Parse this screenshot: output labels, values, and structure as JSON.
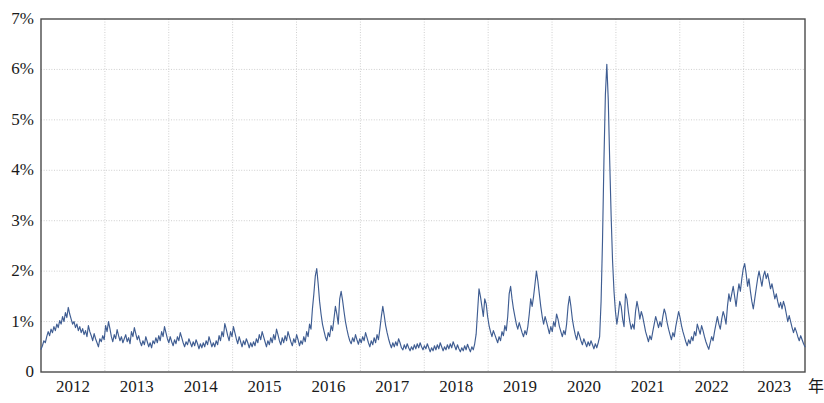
{
  "chart_data": {
    "type": "line",
    "title": "",
    "subtitle": "",
    "xlabel": "年",
    "ylabel": "",
    "grid": true,
    "legend_position": "none",
    "series_color": "#3f5d92",
    "axis_color": "#4a4a4a",
    "grid_color": "#cfcfcf",
    "background": "#ffffff",
    "xlim": [
      2012.0,
      2023.96
    ],
    "ylim": [
      0,
      7
    ],
    "y_ticks": [
      0,
      1,
      2,
      3,
      4,
      5,
      6,
      7
    ],
    "y_tick_labels": [
      "0",
      "1%",
      "2%",
      "3%",
      "4%",
      "5%",
      "6%",
      "7%"
    ],
    "x_ticks": [
      2012,
      2013,
      2014,
      2015,
      2016,
      2017,
      2018,
      2019,
      2020,
      2021,
      2022,
      2023
    ],
    "x_tick_labels": [
      "2012",
      "2013",
      "2014",
      "2015",
      "2016",
      "2017",
      "2018",
      "2019",
      "2020",
      "2021",
      "2022",
      "2023"
    ],
    "x_unit_label": "年",
    "annotations": [],
    "series": [
      {
        "name": "series-1",
        "values": [
          0.45,
          0.52,
          0.62,
          0.58,
          0.7,
          0.8,
          0.72,
          0.85,
          0.78,
          0.9,
          0.82,
          0.95,
          0.88,
          1.02,
          0.95,
          1.1,
          1.0,
          1.18,
          1.08,
          1.28,
          1.15,
          1.05,
          0.95,
          1.0,
          0.88,
          0.95,
          0.82,
          0.9,
          0.78,
          0.86,
          0.74,
          0.82,
          0.7,
          0.92,
          0.8,
          0.72,
          0.62,
          0.76,
          0.66,
          0.58,
          0.5,
          0.66,
          0.6,
          0.72,
          0.64,
          0.92,
          0.8,
          1.0,
          0.86,
          0.7,
          0.6,
          0.74,
          0.66,
          0.84,
          0.72,
          0.62,
          0.7,
          0.58,
          0.66,
          0.74,
          0.6,
          0.68,
          0.56,
          0.8,
          0.7,
          0.88,
          0.76,
          0.64,
          0.72,
          0.6,
          0.52,
          0.62,
          0.54,
          0.7,
          0.6,
          0.5,
          0.58,
          0.48,
          0.62,
          0.56,
          0.68,
          0.58,
          0.72,
          0.62,
          0.8,
          0.7,
          0.9,
          0.78,
          0.66,
          0.58,
          0.7,
          0.6,
          0.52,
          0.64,
          0.56,
          0.7,
          0.62,
          0.78,
          0.68,
          0.58,
          0.5,
          0.6,
          0.54,
          0.66,
          0.58,
          0.5,
          0.6,
          0.52,
          0.64,
          0.56,
          0.46,
          0.56,
          0.48,
          0.58,
          0.5,
          0.62,
          0.54,
          0.7,
          0.6,
          0.5,
          0.58,
          0.5,
          0.62,
          0.54,
          0.72,
          0.62,
          0.8,
          0.7,
          0.96,
          0.85,
          0.72,
          0.62,
          0.8,
          0.7,
          0.9,
          0.78,
          0.66,
          0.56,
          0.7,
          0.6,
          0.5,
          0.62,
          0.54,
          0.66,
          0.58,
          0.48,
          0.58,
          0.5,
          0.6,
          0.52,
          0.66,
          0.58,
          0.74,
          0.64,
          0.8,
          0.7,
          0.6,
          0.5,
          0.62,
          0.54,
          0.68,
          0.58,
          0.74,
          0.64,
          0.85,
          0.74,
          0.62,
          0.54,
          0.68,
          0.58,
          0.72,
          0.62,
          0.8,
          0.7,
          0.6,
          0.52,
          0.66,
          0.58,
          0.74,
          0.64,
          0.52,
          0.62,
          0.55,
          0.7,
          0.6,
          0.8,
          0.7,
          0.95,
          0.85,
          1.25,
          1.55,
          1.9,
          2.05,
          1.75,
          1.4,
          1.15,
          0.95,
          0.82,
          0.7,
          0.62,
          0.78,
          0.7,
          0.92,
          0.82,
          1.05,
          1.3,
          1.15,
          0.95,
          1.45,
          1.6,
          1.42,
          1.2,
          1.0,
          0.85,
          0.72,
          0.62,
          0.56,
          0.68,
          0.6,
          0.74,
          0.64,
          0.55,
          0.66,
          0.58,
          0.7,
          0.62,
          0.78,
          0.68,
          0.58,
          0.5,
          0.62,
          0.54,
          0.68,
          0.58,
          0.74,
          0.64,
          0.86,
          1.1,
          1.3,
          1.12,
          0.92,
          0.78,
          0.66,
          0.56,
          0.48,
          0.58,
          0.5,
          0.6,
          0.52,
          0.66,
          0.58,
          0.48,
          0.44,
          0.54,
          0.46,
          0.56,
          0.48,
          0.42,
          0.5,
          0.44,
          0.54,
          0.46,
          0.56,
          0.48,
          0.58,
          0.5,
          0.44,
          0.52,
          0.46,
          0.56,
          0.48,
          0.4,
          0.48,
          0.42,
          0.52,
          0.44,
          0.54,
          0.46,
          0.58,
          0.5,
          0.42,
          0.5,
          0.44,
          0.54,
          0.46,
          0.56,
          0.48,
          0.6,
          0.52,
          0.44,
          0.54,
          0.46,
          0.4,
          0.48,
          0.42,
          0.52,
          0.44,
          0.55,
          0.47,
          0.4,
          0.5,
          0.44,
          0.56,
          0.75,
          1.2,
          1.65,
          1.5,
          1.3,
          1.1,
          1.45,
          1.35,
          1.1,
          0.92,
          0.8,
          0.7,
          0.82,
          0.74,
          0.66,
          0.58,
          0.7,
          0.62,
          0.8,
          0.72,
          0.92,
          0.82,
          1.1,
          1.55,
          1.7,
          1.45,
          1.25,
          1.1,
          0.95,
          0.85,
          0.98,
          0.88,
          0.78,
          0.7,
          0.82,
          0.74,
          0.9,
          1.15,
          1.45,
          1.3,
          1.5,
          1.75,
          2.0,
          1.8,
          1.55,
          1.3,
          1.1,
          0.95,
          1.1,
          1.0,
          0.88,
          0.76,
          0.9,
          0.8,
          1.0,
          0.9,
          1.15,
          1.05,
          0.9,
          0.8,
          0.7,
          0.82,
          0.74,
          0.95,
          1.3,
          1.5,
          1.3,
          1.05,
          0.88,
          0.74,
          0.64,
          0.8,
          0.72,
          0.62,
          0.54,
          0.66,
          0.58,
          0.5,
          0.6,
          0.52,
          0.62,
          0.54,
          0.46,
          0.56,
          0.48,
          0.58,
          0.7,
          1.4,
          2.6,
          4.2,
          5.5,
          6.1,
          5.4,
          4.2,
          3.1,
          2.2,
          1.6,
          1.2,
          0.95,
          1.15,
          1.4,
          1.3,
          1.05,
          0.9,
          1.55,
          1.45,
          1.2,
          1.0,
          0.85,
          0.95,
          0.85,
          1.2,
          1.4,
          1.25,
          1.05,
          1.2,
          1.1,
          0.95,
          0.8,
          0.7,
          0.6,
          0.72,
          0.64,
          0.8,
          0.95,
          1.1,
          1.0,
          0.88,
          1.0,
          0.9,
          1.1,
          1.25,
          1.15,
          0.98,
          0.85,
          0.74,
          0.64,
          0.78,
          0.7,
          0.9,
          1.05,
          1.2,
          1.08,
          0.92,
          0.8,
          0.7,
          0.6,
          0.52,
          0.64,
          0.56,
          0.7,
          0.62,
          0.8,
          0.72,
          0.95,
          0.85,
          0.75,
          0.92,
          0.82,
          0.7,
          0.6,
          0.52,
          0.45,
          0.58,
          0.7,
          0.62,
          0.8,
          0.95,
          1.1,
          0.95,
          0.85,
          1.05,
          1.2,
          1.1,
          0.95,
          1.3,
          1.55,
          1.4,
          1.55,
          1.7,
          1.5,
          1.3,
          1.55,
          1.75,
          1.6,
          1.85,
          2.05,
          2.15,
          1.95,
          1.7,
          1.85,
          1.6,
          1.4,
          1.25,
          1.45,
          1.65,
          1.85,
          2.0,
          1.85,
          1.7,
          1.9,
          2.0,
          1.85,
          1.95,
          1.8,
          1.65,
          1.75,
          1.6,
          1.45,
          1.55,
          1.4,
          1.28,
          1.38,
          1.25,
          1.4,
          1.3,
          1.15,
          1.0,
          1.12,
          1.0,
          0.88,
          0.78,
          0.88,
          0.8,
          0.7,
          0.62,
          0.72,
          0.64,
          0.56,
          0.5
        ]
      }
    ]
  }
}
